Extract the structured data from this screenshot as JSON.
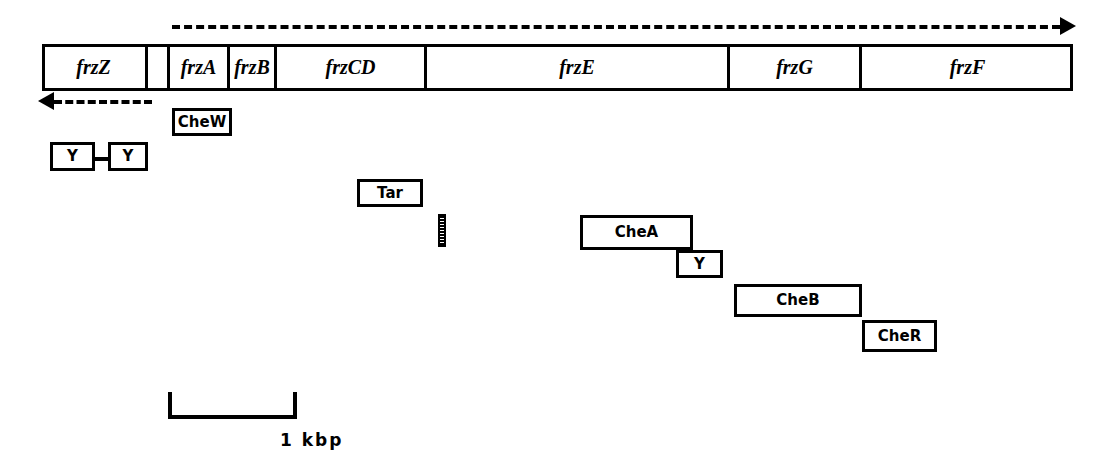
{
  "figure": {
    "width": 1103,
    "height": 473,
    "ink_color": "#000000",
    "background_color": "#ffffff"
  },
  "gene_bar": {
    "name": "frz gene cluster",
    "segments": [
      {
        "label": "frzZ",
        "x": 42,
        "width": 106
      },
      {
        "label": "",
        "x": 148,
        "width": 22
      },
      {
        "label": "frzA",
        "x": 170,
        "width": 60
      },
      {
        "label": "frzB",
        "x": 230,
        "width": 47
      },
      {
        "label": "frzCD",
        "x": 277,
        "width": 150
      },
      {
        "label": "frzE",
        "x": 427,
        "width": 303
      },
      {
        "label": "frzG",
        "x": 730,
        "width": 132
      },
      {
        "label": "frzF",
        "x": 862,
        "width": 211
      }
    ]
  },
  "transcripts": [
    {
      "name": "rightward-transcript-arrow",
      "direction": "right",
      "label": "",
      "x1": 172,
      "x2": 1060,
      "y": 25
    },
    {
      "name": "leftward-transcript-arrow",
      "direction": "left",
      "label": "",
      "x1": 38,
      "x2": 152,
      "y": 100
    }
  ],
  "homology_boxes": [
    {
      "name": "chew-box",
      "label": "CheW",
      "x": 172,
      "y": 108,
      "width": 60,
      "height": 28
    },
    {
      "name": "y-box-1",
      "label": "Y",
      "x": 50,
      "y": 142,
      "width": 45,
      "height": 29
    },
    {
      "name": "y-box-2",
      "label": "Y",
      "x": 108,
      "y": 142,
      "width": 40,
      "height": 29
    },
    {
      "name": "tar-box",
      "label": "Tar",
      "x": 357,
      "y": 179,
      "width": 66,
      "height": 28
    },
    {
      "name": "chea-box",
      "label": "CheA",
      "x": 580,
      "y": 215,
      "width": 113,
      "height": 35
    },
    {
      "name": "y-box-3",
      "label": "Y",
      "x": 676,
      "y": 250,
      "width": 47,
      "height": 28
    },
    {
      "name": "cheb-box",
      "label": "CheB",
      "x": 734,
      "y": 284,
      "width": 128,
      "height": 33
    },
    {
      "name": "cher-box",
      "label": "CheR",
      "x": 862,
      "y": 320,
      "width": 75,
      "height": 32
    }
  ],
  "connector": {
    "name": "y-to-y-connector",
    "x": 95,
    "y": 157,
    "width": 13
  },
  "hatch_block": {
    "name": "hatched-motif-block",
    "x": 438,
    "y": 214,
    "width": 8,
    "height": 33
  },
  "scale": {
    "name": "scale-bar",
    "label": "1 kbp",
    "x": 168,
    "y": 392,
    "width": 129,
    "height": 27,
    "label_x": 280,
    "label_y": 430
  }
}
